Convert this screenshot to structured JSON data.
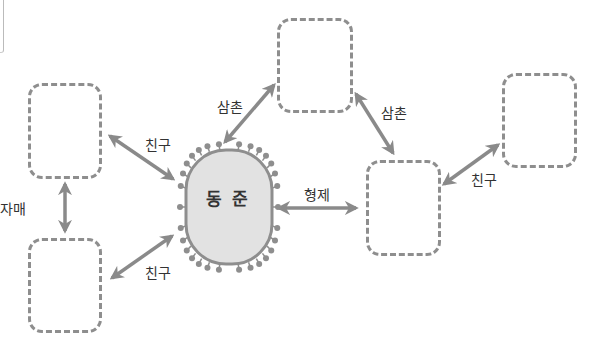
{
  "center": {
    "name": "동 준",
    "fill": "#e2e2e2",
    "border": "#8e8e8e"
  },
  "boxes": [
    {
      "id": "top",
      "x": 277,
      "y": 18,
      "w": 76,
      "h": 95
    },
    {
      "id": "left-top",
      "x": 28,
      "y": 83,
      "w": 74,
      "h": 96
    },
    {
      "id": "left-bottom",
      "x": 28,
      "y": 238,
      "w": 74,
      "h": 95
    },
    {
      "id": "right-middle",
      "x": 366,
      "y": 160,
      "w": 75,
      "h": 96
    },
    {
      "id": "right-top",
      "x": 502,
      "y": 73,
      "w": 75,
      "h": 95
    }
  ],
  "relations": {
    "friend_left_top": "친구",
    "friend_left_bottom": "친구",
    "sisters": "자매",
    "uncle_left": "삼촌",
    "uncle_right": "삼촌",
    "brothers": "형제",
    "friend_right": "친구"
  },
  "colors": {
    "arrow": "#8a8a8a",
    "dashed_border": "#8e8e8e",
    "text": "#333333"
  }
}
